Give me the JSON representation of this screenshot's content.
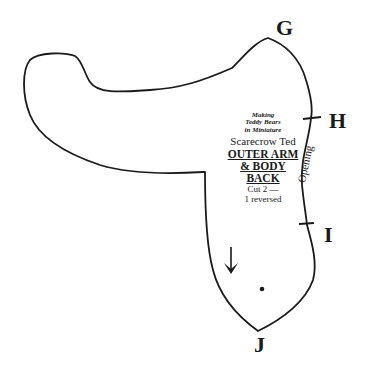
{
  "pattern": {
    "points": {
      "G": "G",
      "H": "H",
      "I": "I",
      "J": "J"
    },
    "book_title_lines": [
      "Making",
      "Teddy Bears",
      "in Miniature"
    ],
    "bear_name": "Scarecrow Ted",
    "piece_name_lines": [
      "OUTER ARM",
      "& BODY",
      "BACK"
    ],
    "cut_instruction_lines": [
      "Cut 2 —",
      "1 reversed"
    ],
    "edge_note": "Opening",
    "grainline": "down-arrow",
    "marker": "dot",
    "stroke_color": "#1a1a1a",
    "background_color": "#ffffff"
  }
}
